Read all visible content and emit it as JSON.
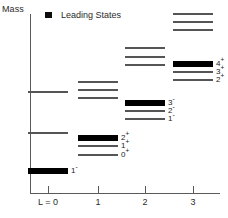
{
  "axis": {
    "y_title": "Mass",
    "x_tick_labels": [
      "L = 0",
      "1",
      "2",
      "3"
    ]
  },
  "legend": {
    "marker": "filled-square-marker",
    "label": "Leading States"
  },
  "chart_data": {
    "type": "scatter",
    "title": "",
    "subtitle": "",
    "xlabel": "L",
    "ylabel": "Mass",
    "xlim": [
      -0.4,
      3.8
    ],
    "ylim": [
      0,
      1
    ],
    "grid": false,
    "legend_position": "top-left",
    "legend_entries": [
      "Leading States"
    ],
    "x": [
      0,
      1,
      2,
      3
    ],
    "categories": [
      "L = 0",
      "1",
      "2",
      "3"
    ],
    "series": [
      {
        "name": "L = 0",
        "x": 0,
        "levels": [
          {
            "label": "",
            "y_px": 92,
            "leading": false
          },
          {
            "label": "",
            "y_px": 133,
            "leading": false
          },
          {
            "label": "1-",
            "y_px": 171,
            "leading": true
          }
        ]
      },
      {
        "name": "L = 1",
        "x": 1,
        "levels": [
          {
            "label": "",
            "y_px": 82,
            "leading": false
          },
          {
            "label": "",
            "y_px": 90,
            "leading": false
          },
          {
            "label": "",
            "y_px": 98,
            "leading": false
          },
          {
            "label": "2+",
            "y_px": 138,
            "leading": true
          },
          {
            "label": "1+",
            "y_px": 146,
            "leading": false
          },
          {
            "label": "0+",
            "y_px": 155,
            "leading": false
          }
        ]
      },
      {
        "name": "L = 2",
        "x": 2,
        "levels": [
          {
            "label": "",
            "y_px": 48,
            "leading": false
          },
          {
            "label": "",
            "y_px": 57,
            "leading": false
          },
          {
            "label": "",
            "y_px": 65,
            "leading": false
          },
          {
            "label": "3-",
            "y_px": 103,
            "leading": true
          },
          {
            "label": "2-",
            "y_px": 111,
            "leading": false
          },
          {
            "label": "1-",
            "y_px": 119,
            "leading": false
          }
        ]
      },
      {
        "name": "L = 3",
        "x": 3,
        "levels": [
          {
            "label": "",
            "y_px": 14,
            "leading": false
          },
          {
            "label": "",
            "y_px": 22,
            "leading": false
          },
          {
            "label": "",
            "y_px": 30,
            "leading": false
          },
          {
            "label": "4+",
            "y_px": 64,
            "leading": true
          },
          {
            "label": "3+",
            "y_px": 72,
            "leading": false
          },
          {
            "label": "2+",
            "y_px": 80,
            "leading": false
          }
        ]
      }
    ]
  },
  "colors": {
    "leading_state": "#000000",
    "normal_state": "#555555",
    "axis": "#5a5a5a",
    "text": "#2b2b2b",
    "background": "#ffffff"
  },
  "geometry": {
    "column_centers_px": [
      48,
      98,
      145,
      193
    ],
    "level_width_px": 40,
    "leading_thickness_px": 6,
    "normal_thickness_px": 2
  }
}
